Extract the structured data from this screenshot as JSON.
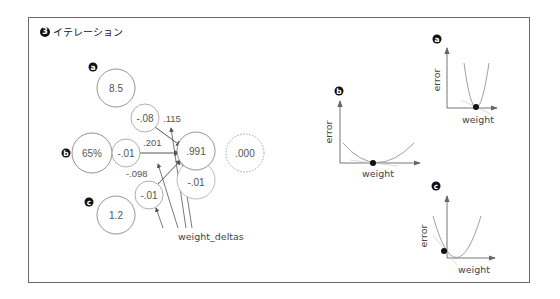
{
  "title": {
    "number": "3",
    "text": "イテレーション"
  },
  "network": {
    "inputs": [
      {
        "badge": "a",
        "value": "8.5",
        "weight_delta": "-.08",
        "weight": ".115"
      },
      {
        "badge": "b",
        "value": "65%",
        "weight_delta": "-.01",
        "weight": ".201"
      },
      {
        "badge": "c",
        "value": "1.2",
        "weight_delta": "-.01",
        "weight": "-.098"
      }
    ],
    "prediction": ".991",
    "delta": "-.01",
    "goal": ".000",
    "weight_deltas_label": "weight_deltas"
  },
  "graphs": [
    {
      "badge": "a",
      "ylabel": "error",
      "xlabel": "weight"
    },
    {
      "badge": "b",
      "ylabel": "error",
      "xlabel": "weight"
    },
    {
      "badge": "c",
      "ylabel": "error",
      "xlabel": "weight"
    }
  ],
  "colors": {
    "node_stroke": "#777777",
    "delta_stroke": "#aaaaaa",
    "arrow": "#555555",
    "badge": "#111111",
    "curve": "#888888"
  }
}
